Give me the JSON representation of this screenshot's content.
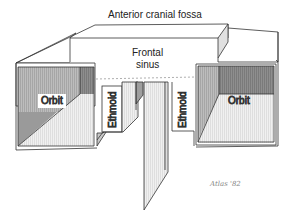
{
  "diagram": {
    "title": "Anterior cranial fossa",
    "labels": {
      "frontal_sinus_line1": "Frontal",
      "frontal_sinus_line2": "sinus",
      "orbit_left": "Orbit",
      "orbit_right": "Orbit",
      "ethmoid_left": "Ethmoid",
      "ethmoid_right": "Ethmoid"
    },
    "signature": "Atlas '82",
    "colors": {
      "line": "#333333",
      "shade_dark": "#8a8a8a",
      "shade_mid": "#b5b5b5",
      "shade_light": "#e2e2e2",
      "background": "#ffffff"
    }
  }
}
